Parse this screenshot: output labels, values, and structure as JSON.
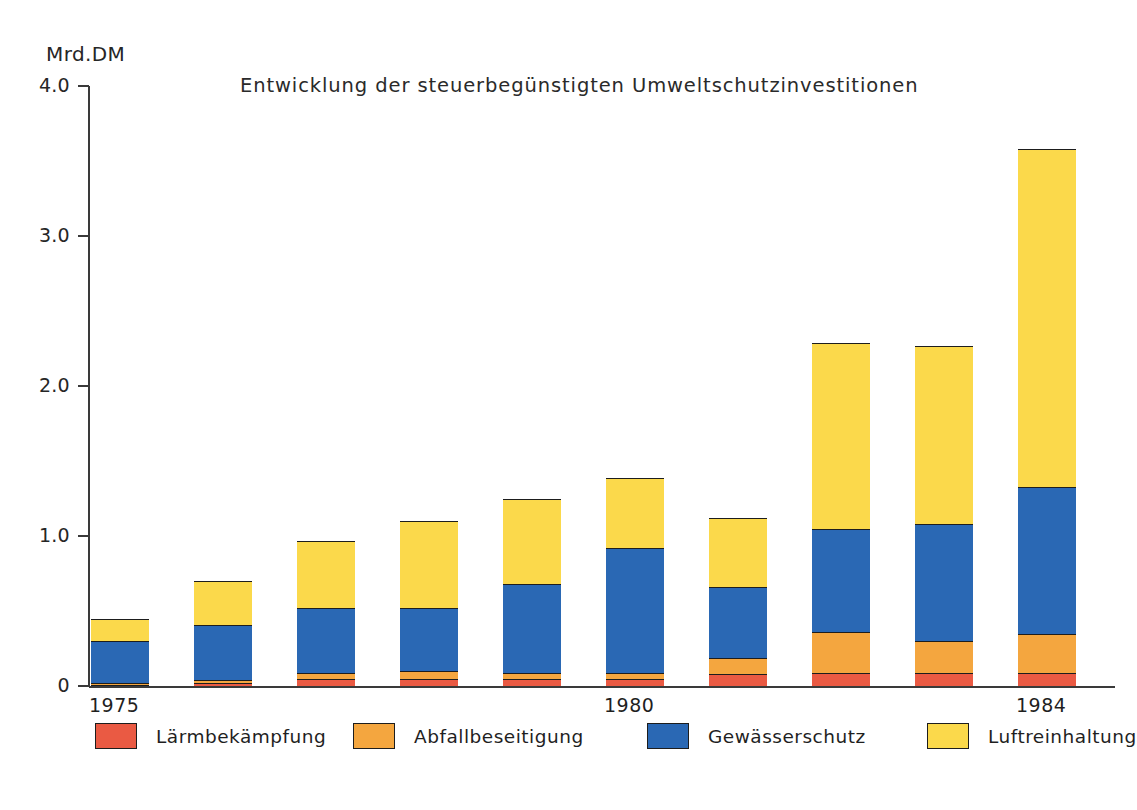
{
  "chart_data": {
    "type": "bar",
    "subtype": "stacked",
    "title": "Entwicklung der steuerbegünstigten Umweltschutzinvestitionen",
    "xlabel": "",
    "ylabel": "Mrd.DM",
    "y_unit_caption": "Mrd.DM",
    "categories": [
      "1975",
      "1976",
      "1977",
      "1978",
      "1979",
      "1980",
      "1981",
      "1982",
      "1983",
      "1984"
    ],
    "visible_tick_labels_x": [
      "1975",
      "1980",
      "1984"
    ],
    "tick_labels_y": [
      "0",
      "1.0",
      "2.0",
      "3.0",
      "4.0"
    ],
    "tick_values_y": [
      0,
      1.0,
      2.0,
      3.0,
      4.0
    ],
    "ylim": [
      0,
      4.0
    ],
    "grid": false,
    "legend_position": "bottom",
    "series": [
      {
        "name": "Lärmbekämpfung",
        "color": "#ea5a43",
        "values": [
          0.01,
          0.02,
          0.05,
          0.05,
          0.05,
          0.05,
          0.08,
          0.09,
          0.09,
          0.09
        ]
      },
      {
        "name": "Abfallbeseitigung",
        "color": "#f4a63f",
        "values": [
          0.01,
          0.02,
          0.04,
          0.05,
          0.04,
          0.04,
          0.11,
          0.27,
          0.21,
          0.26
        ]
      },
      {
        "name": "Gewässerschutz",
        "color": "#2a68b4",
        "values": [
          0.28,
          0.37,
          0.43,
          0.42,
          0.59,
          0.83,
          0.47,
          0.69,
          0.78,
          0.98
        ]
      },
      {
        "name": "Luftreinhaltung",
        "color": "#fbd94b",
        "values": [
          0.15,
          0.29,
          0.45,
          0.58,
          0.57,
          0.47,
          0.46,
          1.24,
          1.19,
          2.25
        ]
      }
    ],
    "totals": [
      0.45,
      0.7,
      0.97,
      1.1,
      1.25,
      1.39,
      1.11,
      2.26,
      2.27,
      3.58
    ]
  },
  "axis": {
    "unit_caption": "Mrd.DM"
  },
  "legend": {
    "items": [
      {
        "label": "Lärmbekämpfung",
        "swatch_class": "sw-red"
      },
      {
        "label": "Abfallbeseitigung",
        "swatch_class": "sw-orange"
      },
      {
        "label": "Gewässerschutz",
        "swatch_class": "sw-blue"
      },
      {
        "label": "Luftreinhaltung",
        "swatch_class": "sw-yellow"
      }
    ]
  },
  "colors": {
    "noise": "#ea5a43",
    "waste": "#f4a63f",
    "water": "#2a68b4",
    "air": "#fbd94b",
    "axis": "#3a3a3a",
    "background": "#ffffff",
    "text": "#1f1f1f"
  }
}
